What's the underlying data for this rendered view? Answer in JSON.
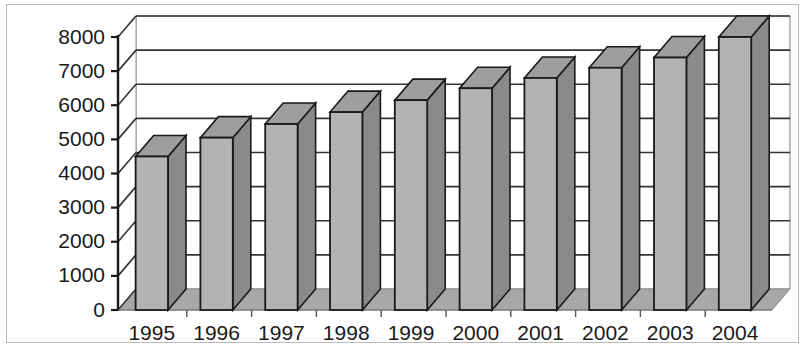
{
  "chart_data": {
    "type": "bar",
    "title": "",
    "subtitle": "",
    "xlabel": "",
    "ylabel": "",
    "categories": [
      "1995",
      "1996",
      "1997",
      "1998",
      "1999",
      "2000",
      "2001",
      "2002",
      "2003",
      "2004"
    ],
    "values": [
      4500,
      5050,
      5450,
      5800,
      6150,
      6500,
      6800,
      7100,
      7400,
      8000
    ],
    "series": [
      {
        "name": "",
        "values": [
          4500,
          5050,
          5450,
          5800,
          6150,
          6500,
          6800,
          7100,
          7400,
          8000
        ]
      }
    ],
    "ylim": [
      0,
      8000
    ],
    "ytick_values": [
      0,
      1000,
      2000,
      3000,
      4000,
      5000,
      6000,
      7000,
      8000
    ],
    "ytick_labels": [
      "0",
      "1000",
      "2000",
      "3000",
      "4000",
      "5000",
      "6000",
      "7000",
      "8000"
    ],
    "grid": true,
    "grid_axis": "y",
    "legend": false,
    "legend_position": "none",
    "style": "3d-column",
    "colors": {
      "bar_front": "#b3b3b3",
      "bar_side": "#8a8a8a",
      "bar_top": "#9e9e9e",
      "bar_outline": "#1a1a1a",
      "plot_background": "#ffffff",
      "floor": "#a8a8a8",
      "gridline": "#333333",
      "axis": "#1a1a1a",
      "frame": "#b9b9b9",
      "text": "#1a1a1a"
    }
  },
  "figure": {
    "frame_label": "chart-frame",
    "plot_label": "plot-area"
  }
}
